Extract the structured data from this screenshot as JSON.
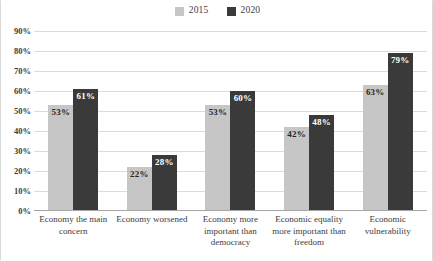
{
  "chart_data": {
    "type": "bar",
    "title": "",
    "subtitle": "",
    "xlabel": "",
    "ylabel": "",
    "ylim": [
      0,
      90
    ],
    "ytick_labels": [
      "90%",
      "80%",
      "70%",
      "60%",
      "50%",
      "40%",
      "30%",
      "20%",
      "10%",
      "0%"
    ],
    "ytick_values": [
      90,
      80,
      70,
      60,
      50,
      40,
      30,
      20,
      10,
      0
    ],
    "grid": true,
    "legend_position": "top-center",
    "categories": [
      "Economy the main concern",
      "Economy worsened",
      "Economy more important than democracy",
      "Economic equality more important than freedom",
      "Economic vulnerability"
    ],
    "series": [
      {
        "name": "2015",
        "color": "#c6c6c6",
        "label_color": "#262626",
        "values": [
          53,
          22,
          53,
          42,
          63
        ],
        "data_labels": [
          "53%",
          "22%",
          "53%",
          "42%",
          "63%"
        ]
      },
      {
        "name": "2020",
        "color": "#3a3a3a",
        "label_color": "#ffffff",
        "values": [
          61,
          28,
          60,
          48,
          79
        ],
        "data_labels": [
          "61%",
          "28%",
          "60%",
          "48%",
          "79%"
        ]
      }
    ]
  },
  "legend": {
    "entries": [
      {
        "label": "2015",
        "color": "#c6c6c6"
      },
      {
        "label": "2020",
        "color": "#3a3a3a"
      }
    ]
  },
  "colors": {
    "gridline": "#dcdcdc",
    "axis": "#a6a6a6",
    "background": "#ffffff",
    "text": "#3d3d3d"
  }
}
